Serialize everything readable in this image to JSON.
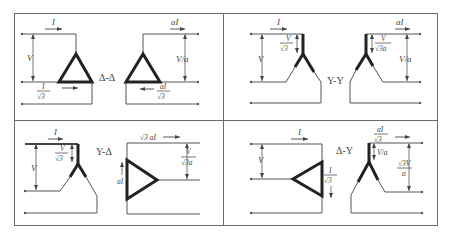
{
  "figure": {
    "panels": [
      {
        "id": "delta-delta",
        "connection_label": "Δ-Δ",
        "primary": {
          "current_label": "I",
          "voltage_label": "V",
          "winding_current_num": "I",
          "winding_current_den": "√3"
        },
        "secondary": {
          "current_label": "aI",
          "voltage_label": "V/a",
          "winding_current_num": "aI",
          "winding_current_den": "√3"
        }
      },
      {
        "id": "wye-wye",
        "connection_label": "Y-Y",
        "primary": {
          "current_label": "I",
          "voltage_label": "V",
          "phase_voltage_num": "V",
          "phase_voltage_den": "√3"
        },
        "secondary": {
          "current_label": "aI",
          "voltage_label": "V/a",
          "phase_voltage_num": "V",
          "phase_voltage_den": "√3a"
        }
      },
      {
        "id": "wye-delta",
        "connection_label": "Y-Δ",
        "primary": {
          "current_label": "I",
          "voltage_label": "V",
          "phase_voltage_num": "V",
          "phase_voltage_den": "√3"
        },
        "secondary": {
          "current_label": "√3 aI",
          "winding_current_label": "aI",
          "voltage_num": "V",
          "voltage_den": "√3a"
        }
      },
      {
        "id": "delta-wye",
        "connection_label": "Δ-Y",
        "primary": {
          "current_label": "I",
          "voltage_label": "V",
          "winding_current_num": "I",
          "winding_current_den": "√3"
        },
        "secondary": {
          "current_num": "aI",
          "current_den": "√3",
          "phase_voltage_label": "V/a",
          "voltage_num": "√3V",
          "voltage_den": "a"
        }
      }
    ]
  }
}
